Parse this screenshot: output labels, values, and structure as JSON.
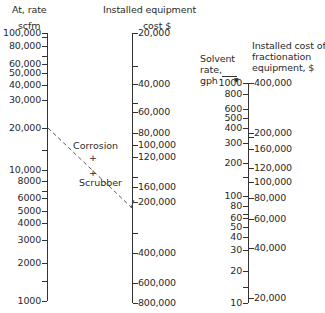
{
  "chart_data": {
    "type": "nomograph",
    "title": "",
    "axes": [
      {
        "id": "air_rate",
        "title_lines": [
          "At, rate",
          "scfm"
        ],
        "scale": "log",
        "ticks_labeled": [
          "100,000",
          "80,000",
          "60,000",
          "50,000",
          "40,000",
          "30,000",
          "20,000",
          "10,000",
          "8000",
          "6000",
          "5000",
          "4000",
          "3000",
          "2000",
          "1000"
        ],
        "range": [
          1000,
          100000
        ]
      },
      {
        "id": "installed_equipment_cost",
        "title_lines": [
          "Installed equipment",
          "cost $"
        ],
        "scale": "log",
        "ticks_labeled": [
          "20,000",
          "40,000",
          "60,000",
          "80,000",
          "100,000",
          "120,000",
          "160,000",
          "200,000",
          "400,000",
          "600,000",
          "800,000"
        ],
        "range": [
          20000,
          800000
        ]
      },
      {
        "id": "solvent_rate",
        "title_lines": [
          "Solvent",
          "rate,",
          "gph"
        ],
        "scale": "log",
        "ticks_labeled": [
          "1000",
          "800",
          "600",
          "500",
          "400",
          "300",
          "200",
          "100",
          "80",
          "60",
          "50",
          "40",
          "30",
          "20",
          "10"
        ],
        "range": [
          10,
          1000
        ]
      },
      {
        "id": "fractionation_cost",
        "title_lines": [
          "Installed cost of",
          "fractionation",
          "equipment, $"
        ],
        "scale": "log",
        "ticks_labeled": [
          "400,000",
          "200,000",
          "160,000",
          "120,000",
          "100,000",
          "80,000",
          "60,000",
          "40,000",
          "20,000"
        ],
        "range": [
          20000,
          400000
        ]
      }
    ],
    "annotations": [
      {
        "label": "Corrosion",
        "marker": "+"
      },
      {
        "label": "Scrubber",
        "marker": "+"
      }
    ],
    "example_line": {
      "from_air_rate": 20000,
      "to_equipment_cost": 200000,
      "style": "dashed"
    }
  },
  "labels": {
    "left_title_1": "At, rate",
    "left_title_2": "scfm",
    "mid_title_1": "Installed equipment",
    "mid_title_2": "cost $",
    "solvent_title_1": "Solvent",
    "solvent_title_2": "rate,",
    "solvent_title_3": "gph",
    "frac_title_1": "Installed cost of",
    "frac_title_2": "fractionation",
    "frac_title_3": "equipment, $",
    "corrosion": "Corrosion",
    "scrubber": "Scrubber",
    "plus": "+",
    "arrow": "▼"
  },
  "left_ticks": [
    {
      "label": "100,000",
      "y": 33
    },
    {
      "label": "",
      "y": 37
    },
    {
      "label": "80,000",
      "y": 46
    },
    {
      "label": "",
      "y": 56
    },
    {
      "label": "60,000",
      "y": 64
    },
    {
      "label": "50,000",
      "y": 73
    },
    {
      "label": "40,000",
      "y": 85
    },
    {
      "label": "30,000",
      "y": 100
    },
    {
      "label": "20,000",
      "y": 128
    },
    {
      "label": "",
      "y": 150
    },
    {
      "label": "10,000",
      "y": 170
    },
    {
      "label": "8000",
      "y": 181
    },
    {
      "label": "",
      "y": 191
    },
    {
      "label": "6000",
      "y": 198
    },
    {
      "label": "5000",
      "y": 211
    },
    {
      "label": "4000",
      "y": 223
    },
    {
      "label": "3000",
      "y": 240
    },
    {
      "label": "2000",
      "y": 263
    },
    {
      "label": "",
      "y": 281
    },
    {
      "label": "1000",
      "y": 301
    }
  ],
  "mid_ticks": [
    {
      "label": "20,000",
      "y": 33
    },
    {
      "label": "",
      "y": 66
    },
    {
      "label": "40,000",
      "y": 84
    },
    {
      "label": "",
      "y": 103
    },
    {
      "label": "60,000",
      "y": 112
    },
    {
      "label": "80,000",
      "y": 133
    },
    {
      "label": "100,000",
      "y": 145
    },
    {
      "label": "120,000",
      "y": 157
    },
    {
      "label": "",
      "y": 177
    },
    {
      "label": "160,000",
      "y": 187
    },
    {
      "label": "200,000",
      "y": 202
    },
    {
      "label": "",
      "y": 233
    },
    {
      "label": "400,000",
      "y": 253
    },
    {
      "label": "600,000",
      "y": 283
    },
    {
      "label": "800,000",
      "y": 303
    }
  ],
  "solvent_ticks": [
    {
      "label": "1000",
      "y": 83
    },
    {
      "label": "800",
      "y": 94
    },
    {
      "label": "600",
      "y": 109
    },
    {
      "label": "500",
      "y": 118
    },
    {
      "label": "400",
      "y": 128
    },
    {
      "label": "300",
      "y": 143
    },
    {
      "label": "200",
      "y": 163
    },
    {
      "label": "",
      "y": 177
    },
    {
      "label": "100",
      "y": 196
    },
    {
      "label": "80",
      "y": 206
    },
    {
      "label": "",
      "y": 214
    },
    {
      "label": "60",
      "y": 218
    },
    {
      "label": "50",
      "y": 227
    },
    {
      "label": "40",
      "y": 237
    },
    {
      "label": "30",
      "y": 250
    },
    {
      "label": "20",
      "y": 271
    },
    {
      "label": "",
      "y": 287
    },
    {
      "label": "10",
      "y": 303
    }
  ],
  "frac_ticks": [
    {
      "label": "400,000",
      "y": 83
    },
    {
      "label": "200,000",
      "y": 133
    },
    {
      "label": "",
      "y": 137
    },
    {
      "label": "160,000",
      "y": 149
    },
    {
      "label": "120,000",
      "y": 168
    },
    {
      "label": "100,000",
      "y": 182
    },
    {
      "label": "80,000",
      "y": 198
    },
    {
      "label": "60,000",
      "y": 219
    },
    {
      "label": "40,000",
      "y": 248
    },
    {
      "label": "20,000",
      "y": 298
    }
  ]
}
